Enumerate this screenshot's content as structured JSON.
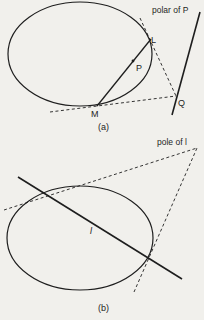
{
  "colors": {
    "background": "#f1f0ec",
    "ink": "#1e1e1e"
  },
  "panel_a": {
    "caption": "(a)",
    "polar_label": "polar of P",
    "points": {
      "L": "L",
      "P": "P",
      "M": "M",
      "Q": "Q"
    }
  },
  "panel_b": {
    "caption": "(b)",
    "pole_label": "pole of l",
    "line_label": "l"
  }
}
